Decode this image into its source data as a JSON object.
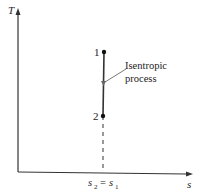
{
  "diagram": {
    "type": "T-s diagram",
    "axes": {
      "y_label": "T",
      "x_label": "s"
    },
    "points": [
      {
        "label": "1"
      },
      {
        "label": "2"
      }
    ],
    "process_label_line1": "Isentropic",
    "process_label_line2": "process",
    "x_tick": {
      "left": "s",
      "left_sub": "2",
      "eq": "=",
      "right": "s",
      "right_sub": "1"
    },
    "colors": {
      "line": "#333333",
      "arrow": "#666666"
    }
  }
}
